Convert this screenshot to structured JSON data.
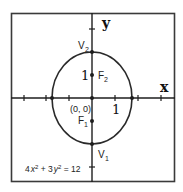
{
  "diagram": {
    "equation": {
      "parts": [
        "4",
        "x",
        "2",
        " + 3",
        "y",
        "2",
        " = 12"
      ],
      "text": "4x² + 3y² = 12"
    },
    "axes": {
      "x_label": "x",
      "y_label": "y",
      "unit_px": 23
    },
    "labels": {
      "origin": "(0, 0)",
      "x_unit": "1",
      "y_unit": "1",
      "vertex_top": "V",
      "vertex_top_sub": "2",
      "vertex_bottom": "V",
      "vertex_bottom_sub": "1",
      "focus_top": "F",
      "focus_top_sub": "2",
      "focus_bottom": "F",
      "focus_bottom_sub": "1"
    },
    "points": {
      "center": [
        0,
        0
      ],
      "V2": [
        0,
        2
      ],
      "V1": [
        0,
        -2
      ],
      "F2": [
        0,
        1
      ],
      "F1": [
        0,
        -1
      ],
      "x_intercepts": [
        [
          -1.732,
          0
        ],
        [
          1.732,
          0
        ]
      ]
    },
    "ellipse": {
      "a": 2,
      "b": 1.732,
      "c": 1,
      "major_axis": "vertical"
    },
    "colors": {
      "stroke": "#2a2a2a",
      "background": "#ffffff"
    }
  }
}
